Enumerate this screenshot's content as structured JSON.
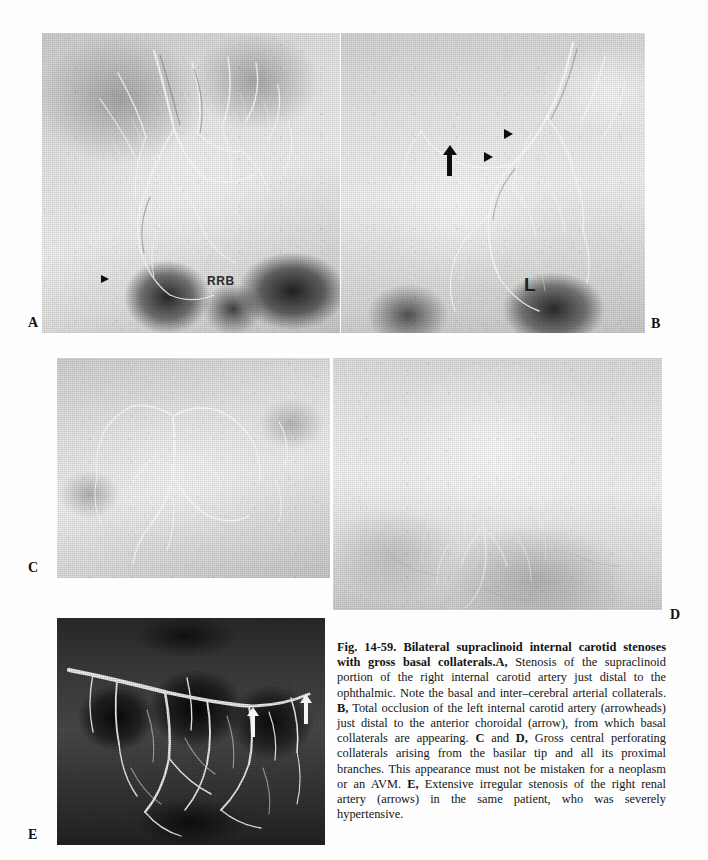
{
  "figure": {
    "number": "Fig. 14-59.",
    "title": "Bilateral supraclinoid internal carotid stenoses with gross basal collaterals.",
    "caption_segments": {
      "label_a": "A,",
      "text_a": " Stenosis of the supraclinoid portion of the right internal carotid artery just distal to the ophthalmic. Note the basal and inter–cerebral arterial collaterals. ",
      "label_b": "B,",
      "text_b": " Total occlusion of the left internal carotid artery (arrowheads) just distal to the anterior choroidal (arrow), from which basal collaterals are appearing. ",
      "label_c": "C",
      "text_cd_join": " and ",
      "label_d": "D,",
      "text_cd": " Gross central perforating collaterals arising from the basilar tip and all its proximal branches. This appearance must not be mistaken for a neoplasm or an AVM. ",
      "label_e": "E,",
      "text_e": " Extensive irregular stenosis of the right renal artery (arrows) in the same patient, who was severely hypertensive."
    },
    "full_caption": "Fig. 14-59. Bilateral supraclinoid internal carotid stenoses with gross basal collaterals. A, Stenosis of the supraclinoid portion of the right internal carotid artery just distal to the ophthalmic. Note the basal and inter–cerebral arterial collaterals. B, Total occlusion of the left internal carotid artery (arrowheads) just distal to the anterior choroidal (arrow), from which basal collaterals are appearing. C and D, Gross central perforating collaterals arising from the basilar tip and all its proximal branches. This appearance must not be mistaken for a neoplasm or an AVM. E, Extensive irregular stenosis of the right renal artery (arrows) in the same patient, who was severely hypertensive."
  },
  "panels": [
    {
      "id": "a",
      "label": "A",
      "modality": "cerebral angiogram",
      "description": "Stenosis of the supraclinoid portion of the right internal carotid artery just distal to the ophthalmic, with basal and inter-cerebral arterial collaterals",
      "annotations": [
        {
          "name": "arrowhead",
          "kind": "arrowhead-right",
          "color": "#0d0d0d"
        },
        {
          "name": "rrb-marker",
          "kind": "text",
          "text": "RRB",
          "color": "#2b2b2b"
        }
      ]
    },
    {
      "id": "b",
      "label": "B",
      "modality": "cerebral angiogram",
      "description": "Total occlusion of the left internal carotid artery just distal to the anterior choroidal, with basal collaterals appearing",
      "annotations": [
        {
          "name": "arrowhead-upper",
          "kind": "arrowhead-right",
          "color": "#0d0d0d"
        },
        {
          "name": "arrowhead-lower",
          "kind": "arrowhead-right",
          "color": "#0d0d0d"
        },
        {
          "name": "arrow",
          "kind": "arrow-up",
          "color": "#0d0d0d"
        },
        {
          "name": "side-marker",
          "kind": "text",
          "text": "L",
          "color": "#1e1e1e"
        }
      ]
    },
    {
      "id": "c",
      "label": "C",
      "modality": "cerebral angiogram",
      "description": "Gross central perforating collaterals arising from the basilar tip and all its proximal branches",
      "annotations": []
    },
    {
      "id": "d",
      "label": "D",
      "modality": "cerebral angiogram",
      "description": "Gross central perforating collaterals arising from the basilar tip and all its proximal branches",
      "annotations": []
    },
    {
      "id": "e",
      "label": "E",
      "modality": "renal angiogram",
      "description": "Extensive irregular stenosis of the right renal artery in a severely hypertensive patient",
      "annotations": [
        {
          "name": "arrow-left",
          "kind": "arrow-up",
          "color": "#f4f4f4"
        },
        {
          "name": "arrow-right",
          "kind": "arrow-up",
          "color": "#f4f4f4"
        }
      ]
    }
  ],
  "colors": {
    "page_background": "#ffffff",
    "caption_text": "#141414",
    "plate_label": "#111111",
    "black_marker": "#0d0d0d",
    "white_marker": "#f4f4f4"
  }
}
